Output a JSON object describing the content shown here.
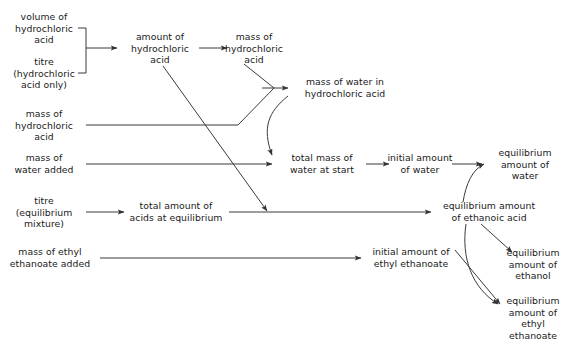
{
  "diagram": {
    "type": "flowchart",
    "title": "",
    "background_color": "#ffffff",
    "line_color": "#3a3a3a",
    "text_color": "#1a1a1a",
    "nodes": [
      {
        "id": "volume-of-hydrochloric-acid",
        "label": "volume of\nhydrochloric\nacid",
        "x": 44,
        "y": 28
      },
      {
        "id": "titre-hydrochloric-acid-only",
        "label": "titre\n(hydrochloric\nacid only)",
        "x": 44,
        "y": 73
      },
      {
        "id": "mass-of-hydrochloric-acid-input",
        "label": "mass of\nhydrochloric\nacid",
        "x": 44,
        "y": 125
      },
      {
        "id": "mass-of-water-added",
        "label": "mass of\nwater added",
        "x": 44,
        "y": 164
      },
      {
        "id": "titre-equilibrium-mixture",
        "label": "titre\n(equilibrium\nmixture)",
        "x": 44,
        "y": 212
      },
      {
        "id": "mass-of-ethyl-ethanoate-added",
        "label": "mass of ethyl\nethanoate added",
        "x": 50,
        "y": 258
      },
      {
        "id": "amount-of-hydrochloric-acid",
        "label": "amount of\nhydrochloric\nacid",
        "x": 160,
        "y": 48
      },
      {
        "id": "mass-of-hydrochloric-acid-derived",
        "label": "mass of\nhydrochloric\nacid",
        "x": 254,
        "y": 48
      },
      {
        "id": "mass-of-water-in-hydrochloric-acid",
        "label": "mass of water in\nhydrochloric acid",
        "x": 345,
        "y": 88
      },
      {
        "id": "total-amount-of-acids-at-equilibrium",
        "label": "total amount of\nacids at equilibrium",
        "x": 176,
        "y": 212
      },
      {
        "id": "total-mass-of-water-at-start",
        "label": "total mass of\nwater at start",
        "x": 322,
        "y": 164
      },
      {
        "id": "initial-amount-of-water",
        "label": "initial amount\nof water",
        "x": 420,
        "y": 164
      },
      {
        "id": "equilibrium-amount-of-water",
        "label": "equilibrium\namount of water",
        "x": 525,
        "y": 164
      },
      {
        "id": "equilibrium-amount-of-ethanoic-acid",
        "label": "equilibrium amount\nof ethanoic acid",
        "x": 489,
        "y": 212
      },
      {
        "id": "initial-amount-of-ethyl-ethanoate",
        "label": "initial amount of\nethyl ethanoate",
        "x": 411,
        "y": 258
      },
      {
        "id": "equilibrium-amount-of-ethanol",
        "label": "equilibrium\namount of\nethanol",
        "x": 533,
        "y": 264
      },
      {
        "id": "equilibrium-amount-of-ethyl-ethanoate",
        "label": "equilibrium\namount of\nethyl ethanoate",
        "x": 533,
        "y": 318
      }
    ],
    "edges": [
      {
        "id": "bracket-inputs-to-amount-hcl",
        "from": "volume-of-hydrochloric-acid + titre-hydrochloric-acid-only",
        "to": "amount-of-hydrochloric-acid",
        "style": "bracket-then-arrow"
      },
      {
        "id": "amount-hcl-to-mass-hcl",
        "from": "amount-of-hydrochloric-acid",
        "to": "mass-of-hydrochloric-acid-derived",
        "style": "straight-arrow"
      },
      {
        "id": "mass-hcl-merge-to-water-in-hcl",
        "from": "mass-of-hydrochloric-acid-derived + mass-of-hydrochloric-acid-input",
        "to": "mass-of-water-in-hydrochloric-acid",
        "style": "merge-arrow"
      },
      {
        "id": "water-in-hcl-to-total-mass-water",
        "from": "mass-of-water-in-hydrochloric-acid",
        "to": "total-mass-of-water-at-start",
        "style": "curved-arrow"
      },
      {
        "id": "mass-water-added-to-total-mass-water",
        "from": "mass-of-water-added",
        "to": "total-mass-of-water-at-start",
        "style": "straight-arrow"
      },
      {
        "id": "amount-hcl-to-acids-equilibrium",
        "from": "amount-of-hydrochloric-acid",
        "to": "total-amount-of-acids-at-equilibrium-line",
        "style": "diagonal-arrow"
      },
      {
        "id": "titre-eq-to-total-acids",
        "from": "titre-equilibrium-mixture",
        "to": "total-amount-of-acids-at-equilibrium",
        "style": "straight-arrow"
      },
      {
        "id": "total-acids-to-eq-ethanoic",
        "from": "total-amount-of-acids-at-equilibrium",
        "to": "equilibrium-amount-of-ethanoic-acid",
        "style": "straight-arrow"
      },
      {
        "id": "total-mass-water-to-initial-water",
        "from": "total-mass-of-water-at-start",
        "to": "initial-amount-of-water",
        "style": "straight-arrow"
      },
      {
        "id": "initial-water-to-eq-water",
        "from": "initial-amount-of-water",
        "to": "equilibrium-amount-of-water",
        "style": "straight-arrow"
      },
      {
        "id": "eq-ethanoic-to-eq-water",
        "from": "equilibrium-amount-of-ethanoic-acid",
        "to": "equilibrium-amount-of-water",
        "style": "curved-arrow"
      },
      {
        "id": "eq-ethanoic-to-eq-ethanol",
        "from": "equilibrium-amount-of-ethanoic-acid",
        "to": "equilibrium-amount-of-ethanol",
        "style": "diagonal-arrow"
      },
      {
        "id": "eq-ethanoic-to-eq-ethyl-ethanoate",
        "from": "equilibrium-amount-of-ethanoic-acid",
        "to": "equilibrium-amount-of-ethyl-ethanoate",
        "style": "curved-arrow"
      },
      {
        "id": "mass-ethyl-ethanoate-to-initial-ethyl-ethanoate",
        "from": "mass-of-ethyl-ethanoate-added",
        "to": "initial-amount-of-ethyl-ethanoate",
        "style": "straight-arrow"
      },
      {
        "id": "initial-ethyl-ethanoate-to-eq-ethyl-ethanoate",
        "from": "initial-amount-of-ethyl-ethanoate",
        "to": "equilibrium-amount-of-ethyl-ethanoate",
        "style": "diagonal-arrow"
      }
    ]
  }
}
